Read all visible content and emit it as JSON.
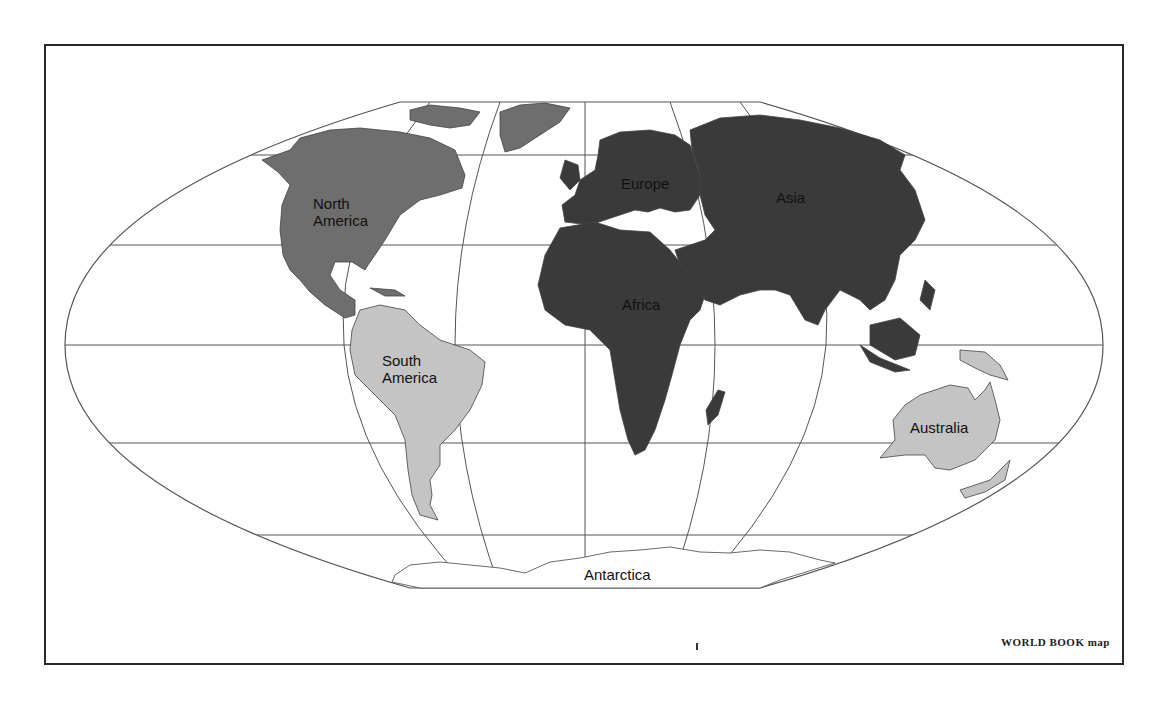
{
  "map": {
    "projection": "elliptical world map",
    "credit": "WORLD BOOK map",
    "continents": [
      {
        "name": "North America",
        "line1": "North",
        "line2": "America",
        "fill": "#6e6e6e"
      },
      {
        "name": "South America",
        "line1": "South",
        "line2": "America",
        "fill": "#c4c4c4"
      },
      {
        "name": "Europe",
        "fill": "#3a3a3a"
      },
      {
        "name": "Asia",
        "fill": "#3a3a3a"
      },
      {
        "name": "Africa",
        "fill": "#3a3a3a"
      },
      {
        "name": "Australia",
        "fill": "#c4c4c4"
      },
      {
        "name": "Antarctica",
        "fill": "#ffffff"
      }
    ],
    "colors": {
      "frame": "#2a2a2a",
      "grid": "#555555",
      "dark_fill": "#3a3a3a",
      "medium_fill": "#6e6e6e",
      "light_fill": "#c4c4c4"
    }
  }
}
